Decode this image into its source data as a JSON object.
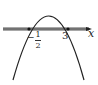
{
  "diagram": {
    "type": "parabola-graph",
    "axis": {
      "label": "x",
      "band_color": "#9a9a9a",
      "line_color": "#222222"
    },
    "curve": {
      "color": "#222222",
      "opens": "down"
    },
    "roots": [
      {
        "numerator": "1",
        "denominator": "2",
        "sign": "−",
        "value": -0.5
      },
      {
        "label": "3",
        "value": 3
      }
    ]
  }
}
